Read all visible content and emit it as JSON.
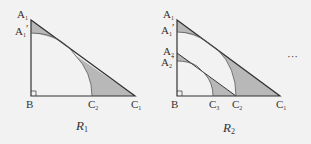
{
  "colors": {
    "background": "#f2f2f2",
    "line": "#333333",
    "shade": "#b8b8b8"
  },
  "figure_r1": {
    "label": "R",
    "label_sub": "1",
    "vertices": {
      "A1": {
        "text": "A",
        "sub": "1"
      },
      "A1_prime": {
        "text": "A",
        "sub": "1",
        "prime": "′"
      },
      "B": {
        "text": "B"
      },
      "C1": {
        "text": "C",
        "sub": "1"
      },
      "C2": {
        "text": "C",
        "sub": "2"
      }
    }
  },
  "figure_r2": {
    "label": "R",
    "label_sub": "2",
    "vertices": {
      "A1": {
        "text": "A",
        "sub": "1"
      },
      "A1_prime": {
        "text": "A",
        "sub": "1",
        "prime": "′"
      },
      "A2": {
        "text": "A",
        "sub": "2"
      },
      "A2_prime": {
        "text": "A",
        "sub": "2",
        "prime": "′"
      },
      "B": {
        "text": "B"
      },
      "C1": {
        "text": "C",
        "sub": "1"
      },
      "C2": {
        "text": "C",
        "sub": "2"
      },
      "C3": {
        "text": "C",
        "sub": "3"
      }
    }
  },
  "continuation": "···"
}
